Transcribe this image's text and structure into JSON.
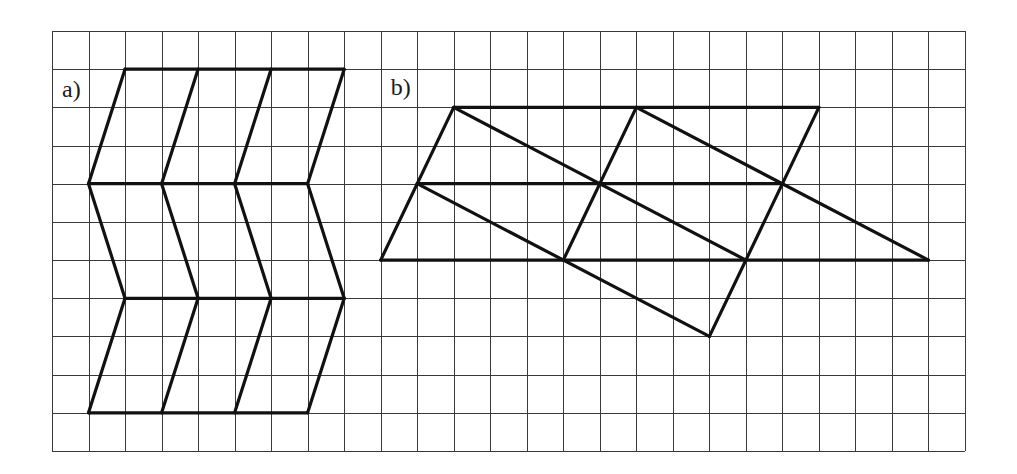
{
  "figure": {
    "grid": {
      "left": 52,
      "top": 31,
      "columns": 25,
      "rows": 11,
      "cell_width": 36.52,
      "cell_height": 38.18,
      "line_color": "#3a3a3a",
      "background": "#ffffff"
    },
    "stroke_color": "#111111",
    "panels": [
      {
        "id": "a",
        "label": "a)",
        "label_cell": [
          0,
          1
        ],
        "label_offset": [
          10,
          8
        ],
        "segments": [
          [
            [
              2,
              1
            ],
            [
              8,
              1
            ]
          ],
          [
            [
              1,
              4
            ],
            [
              7,
              4
            ]
          ],
          [
            [
              2,
              7
            ],
            [
              8,
              7
            ]
          ],
          [
            [
              1,
              10
            ],
            [
              7,
              10
            ]
          ],
          [
            [
              2,
              1
            ],
            [
              1,
              4
            ]
          ],
          [
            [
              4,
              1
            ],
            [
              3,
              4
            ]
          ],
          [
            [
              6,
              1
            ],
            [
              5,
              4
            ]
          ],
          [
            [
              8,
              1
            ],
            [
              7,
              4
            ]
          ],
          [
            [
              1,
              4
            ],
            [
              2,
              7
            ]
          ],
          [
            [
              3,
              4
            ],
            [
              4,
              7
            ]
          ],
          [
            [
              5,
              4
            ],
            [
              6,
              7
            ]
          ],
          [
            [
              7,
              4
            ],
            [
              8,
              7
            ]
          ],
          [
            [
              2,
              7
            ],
            [
              1,
              10
            ]
          ],
          [
            [
              4,
              7
            ],
            [
              3,
              10
            ]
          ],
          [
            [
              6,
              7
            ],
            [
              5,
              10
            ]
          ],
          [
            [
              8,
              7
            ],
            [
              7,
              10
            ]
          ]
        ]
      },
      {
        "id": "b",
        "label": "b)",
        "label_cell": [
          9,
          1
        ],
        "label_offset": [
          10,
          6
        ],
        "segments": [
          [
            [
              11,
              2
            ],
            [
              21,
              2
            ]
          ],
          [
            [
              10,
              4
            ],
            [
              20,
              4
            ]
          ],
          [
            [
              9,
              6
            ],
            [
              24,
              6
            ]
          ],
          [
            [
              11,
              2
            ],
            [
              9,
              6
            ]
          ],
          [
            [
              16,
              2
            ],
            [
              14,
              6
            ]
          ],
          [
            [
              21,
              2
            ],
            [
              18,
              8
            ]
          ],
          [
            [
              11,
              2
            ],
            [
              19,
              6
            ]
          ],
          [
            [
              16,
              2
            ],
            [
              24,
              6
            ]
          ],
          [
            [
              10,
              4
            ],
            [
              18,
              8
            ]
          ]
        ]
      }
    ]
  }
}
